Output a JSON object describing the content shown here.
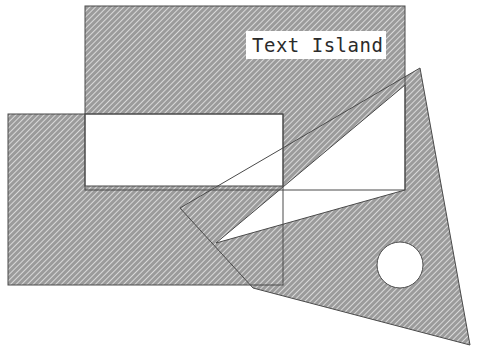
{
  "canvas": {
    "width": 486,
    "height": 358,
    "background_color": "#ffffff"
  },
  "drawing": {
    "kind": "cad-hatched-region",
    "hatch": {
      "name": "diagonal-hatch-pattern",
      "angle_deg": 45,
      "direction": "bottom-left-to-top-right",
      "line_color": "#ffffff",
      "fill_color": "#9b9b9b",
      "spacing_px": 4,
      "line_width_px": 1
    },
    "outline_color": "#4a4a4a",
    "outline_width_px": 1
  },
  "text_island": {
    "label": "Text Island",
    "background_color": "#ffffff",
    "text_color": "#2b2b2b",
    "box": {
      "x": 246,
      "y": 31,
      "width": 140,
      "height": 28
    },
    "text_x": 252,
    "text_baseline_y": 52
  },
  "shapes": [
    {
      "name": "top-rectangle",
      "type": "rect",
      "filled": true,
      "x": 85,
      "y": 6,
      "width": 320,
      "height": 184
    },
    {
      "name": "left-rectangle",
      "type": "rect",
      "filled": true,
      "x": 8,
      "y": 114,
      "width": 275,
      "height": 171
    },
    {
      "name": "right-quadrilateral",
      "type": "polygon",
      "filled": true,
      "points": "420,68 470,345 253,288 180,208"
    },
    {
      "name": "rectangular-hole",
      "type": "rect",
      "filled": false,
      "x": 85,
      "y": 114,
      "width": 198,
      "height": 72
    },
    {
      "name": "triangular-hole",
      "type": "polygon",
      "filled": false,
      "points": "216,243 405,85 405,190"
    },
    {
      "name": "circular-hole",
      "type": "circle",
      "filled": false,
      "cx": 400,
      "cy": 265,
      "r": 23
    }
  ],
  "legend": {
    "hatched_region_name": "hatched-region",
    "island_name": "text-island"
  }
}
